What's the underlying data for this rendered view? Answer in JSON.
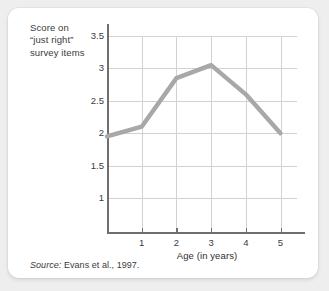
{
  "figure": {
    "y_axis_caption": "Score on\n“just right”\nsurvey items",
    "x_axis_title": "Age (in years)",
    "source_prefix": "Source:",
    "source_text": " Evans et al., 1997.",
    "line_color": "#a8a8a8",
    "grid_color": "#d2d2d2",
    "axis_color": "#6f6f6f",
    "card_background": "#ffffff",
    "page_background": "#eeeeee"
  },
  "chart_data": {
    "type": "line",
    "title": "",
    "subtitle": "",
    "xlabel": "Age (in years)",
    "ylabel": "Score on “just right” survey items",
    "x": [
      0,
      1,
      2,
      3,
      4,
      5
    ],
    "values": [
      1.95,
      2.1,
      2.85,
      3.05,
      2.6,
      2.0
    ],
    "xticklabels": [
      "1",
      "2",
      "3",
      "4",
      "5"
    ],
    "xtickvalues": [
      1,
      2,
      3,
      4,
      5
    ],
    "yticklabels": [
      "3.5",
      "3",
      "2.5",
      "2",
      "1.5",
      "1"
    ],
    "ytickvalues": [
      3.5,
      3,
      2.5,
      2,
      1.5,
      1
    ],
    "xlim": [
      -0.2,
      5.5
    ],
    "ylim": [
      0.5,
      3.7
    ],
    "grid": "horizontal-and-vertical",
    "legend": "none",
    "series": [
      {
        "name": "Score on “just right” survey items",
        "values": [
          1.95,
          2.1,
          2.85,
          3.05,
          2.6,
          2.0
        ]
      }
    ],
    "annotations": [
      "Source: Evans et al., 1997."
    ]
  }
}
